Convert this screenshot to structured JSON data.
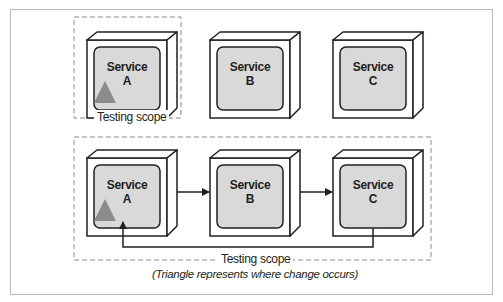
{
  "diagram": {
    "top_row": {
      "services": [
        {
          "name": "Service",
          "id": "A",
          "changed": true
        },
        {
          "name": "Service",
          "id": "B",
          "changed": false
        },
        {
          "name": "Service",
          "id": "C",
          "changed": false
        }
      ],
      "scope_label": "Testing scope"
    },
    "bottom_row": {
      "services": [
        {
          "name": "Service",
          "id": "A",
          "changed": true
        },
        {
          "name": "Service",
          "id": "B",
          "changed": false
        },
        {
          "name": "Service",
          "id": "C",
          "changed": false
        }
      ],
      "flows": [
        "A → B",
        "B → C",
        "C → A"
      ],
      "scope_label": "Testing scope",
      "caption": "(Triangle represents where change occurs)"
    },
    "colors": {
      "box_fill": "#d9d9d9",
      "outline": "#231f20",
      "triangle": "#8c8c8c",
      "dashed": "#8a8a8a",
      "frame": "#b9b9b9"
    }
  }
}
